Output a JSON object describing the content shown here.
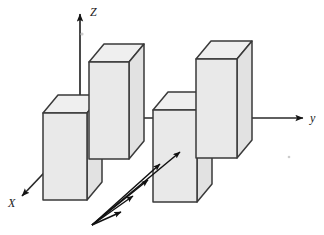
{
  "figure": {
    "background_color": "#ffffff",
    "width": 324,
    "height": 235
  },
  "axes": [
    {
      "id": "z",
      "label": "Z",
      "name": "z-axis",
      "direction": "up",
      "label_x": 90,
      "label_y": 16,
      "line": {
        "x1": 80,
        "y1": 135,
        "x2": 80,
        "y2": 14
      },
      "arrow_at": "end"
    },
    {
      "id": "y",
      "label": "y",
      "name": "y-axis",
      "direction": "right",
      "label_x": 310,
      "label_y": 122,
      "line": {
        "x1": 80,
        "y1": 118,
        "x2": 303,
        "y2": 118
      },
      "arrow_at": "end"
    },
    {
      "id": "x",
      "label": "X",
      "name": "x-axis",
      "direction": "down-left",
      "label_x": 8,
      "label_y": 207,
      "line": {
        "x1": 80,
        "y1": 135,
        "x2": 22,
        "y2": 196
      },
      "arrow_at": "end"
    }
  ],
  "blocks": [
    {
      "id": "block-1",
      "name": "block-front-left",
      "front": {
        "x": 43,
        "y": 113,
        "w": 44,
        "h": 87
      },
      "depth_dx": 15,
      "depth_dy": -18,
      "face_color": "#e9e9e9",
      "top_color": "#efefef",
      "side_color": "#e2e2e2",
      "stroke_color": "#3a3a3a"
    },
    {
      "id": "block-2",
      "name": "block-back-left",
      "front": {
        "x": 89,
        "y": 62,
        "w": 40,
        "h": 97
      },
      "depth_dx": 15,
      "depth_dy": -18,
      "face_color": "#e9e9e9",
      "top_color": "#efefef",
      "side_color": "#e2e2e2",
      "stroke_color": "#3a3a3a"
    },
    {
      "id": "block-3",
      "name": "block-front-middle",
      "front": {
        "x": 153,
        "y": 110,
        "w": 44,
        "h": 92
      },
      "depth_dx": 15,
      "depth_dy": -18,
      "face_color": "#e9e9e9",
      "top_color": "#efefef",
      "side_color": "#e2e2e2",
      "stroke_color": "#3a3a3a"
    },
    {
      "id": "block-4",
      "name": "block-back-right",
      "front": {
        "x": 196,
        "y": 59,
        "w": 41,
        "h": 99
      },
      "depth_dx": 15,
      "depth_dy": -18,
      "face_color": "#e9e9e9",
      "top_color": "#efefef",
      "side_color": "#e2e2e2",
      "stroke_color": "#3a3a3a"
    }
  ],
  "ray_fan": {
    "name": "incident-ray-fan",
    "origin": {
      "x": 92,
      "y": 225
    },
    "color": "#111111",
    "count": 5,
    "rays": [
      {
        "id": "ray-1",
        "x2": 180,
        "y2": 152
      },
      {
        "id": "ray-2",
        "x2": 160,
        "y2": 164
      },
      {
        "id": "ray-3",
        "x2": 148,
        "y2": 180
      },
      {
        "id": "ray-4",
        "x2": 133,
        "y2": 196
      },
      {
        "id": "ray-5",
        "x2": 121,
        "y2": 212
      }
    ]
  },
  "artifacts": [
    {
      "id": "speck-1",
      "name": "scan-speck",
      "x": 82,
      "y": 34,
      "r": 1.6
    },
    {
      "id": "speck-2",
      "name": "scan-speck",
      "x": 289,
      "y": 157,
      "r": 1.3
    }
  ]
}
